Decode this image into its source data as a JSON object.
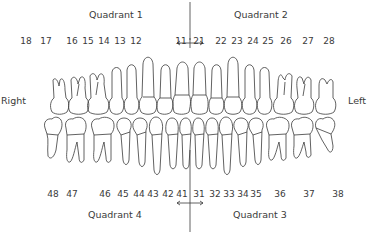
{
  "quadrants": {
    "q1": "Quadrant 1",
    "q2": "Quadrant 2",
    "q3": "Quadrant 3",
    "q4": "Quadrant 4"
  },
  "sides": {
    "right": "Right",
    "left": "Left"
  },
  "upper_numbers": [
    {
      "n": "18",
      "x": 26
    },
    {
      "n": "17",
      "x": 46
    },
    {
      "n": "16",
      "x": 72
    },
    {
      "n": "15",
      "x": 88
    },
    {
      "n": "14",
      "x": 104
    },
    {
      "n": "13",
      "x": 120
    },
    {
      "n": "12",
      "x": 136
    },
    {
      "n": "11",
      "x": 181
    },
    {
      "n": "21",
      "x": 199
    },
    {
      "n": "22",
      "x": 221
    },
    {
      "n": "23",
      "x": 237
    },
    {
      "n": "24",
      "x": 253
    },
    {
      "n": "25",
      "x": 268
    },
    {
      "n": "26",
      "x": 286
    },
    {
      "n": "27",
      "x": 308
    },
    {
      "n": "28",
      "x": 329
    }
  ],
  "lower_numbers": [
    {
      "n": "48",
      "x": 53
    },
    {
      "n": "47",
      "x": 72
    },
    {
      "n": "46",
      "x": 105
    },
    {
      "n": "45",
      "x": 123
    },
    {
      "n": "44",
      "x": 139
    },
    {
      "n": "43",
      "x": 153
    },
    {
      "n": "42",
      "x": 168
    },
    {
      "n": "41",
      "x": 182
    },
    {
      "n": "31",
      "x": 199
    },
    {
      "n": "32",
      "x": 215
    },
    {
      "n": "33",
      "x": 229
    },
    {
      "n": "34",
      "x": 243
    },
    {
      "n": "35",
      "x": 256
    },
    {
      "n": "36",
      "x": 280
    },
    {
      "n": "37",
      "x": 309
    },
    {
      "n": "38",
      "x": 338
    }
  ],
  "colors": {
    "line": "#3a3a3a",
    "text": "#3a3a3a",
    "background": "#ffffff"
  }
}
